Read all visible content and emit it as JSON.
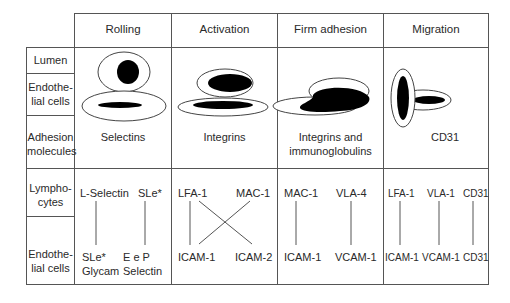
{
  "columns": [
    {
      "id": "rolling",
      "label": "Rolling"
    },
    {
      "id": "activation",
      "label": "Activation"
    },
    {
      "id": "firm_adhesion",
      "label": "Firm adhesion"
    },
    {
      "id": "migration",
      "label": "Migration"
    }
  ],
  "row_labels": {
    "lumen": "Lumen",
    "endothelial_top": [
      "Endothe-",
      "lial cells"
    ],
    "adhesion_molecules": [
      "Adhesion",
      "molecules"
    ],
    "lymphocytes": [
      "Lympho-",
      "cytes"
    ],
    "endothelial_bottom": [
      "Endothe-",
      "lial cells"
    ]
  },
  "adhesion_molecules": {
    "rolling": "Selectins",
    "activation": "Integrins",
    "firm_adhesion": [
      "Integrins and",
      "immunoglobulins"
    ],
    "migration": "CD31"
  },
  "pairs": {
    "rolling": {
      "lymphocyte": [
        "L-Selectin",
        "SLe*"
      ],
      "endothelial": [
        [
          "SLe*",
          "Glycam"
        ],
        [
          "E e P",
          "Selectin"
        ]
      ]
    },
    "activation": {
      "lymphocyte": [
        "LFA-1",
        "MAC-1"
      ],
      "endothelial": [
        "ICAM-1",
        "ICAM-2"
      ]
    },
    "firm_adhesion": {
      "lymphocyte": [
        "MAC-1",
        "VLA-4"
      ],
      "endothelial": [
        "ICAM-1",
        "VCAM-1"
      ]
    },
    "migration": {
      "lymphocyte": [
        "LFA-1",
        "VLA-1",
        "CD31"
      ],
      "endothelial": [
        "ICAM-1",
        "VCAM-1",
        "CD31"
      ]
    }
  },
  "colors": {
    "line": "#555555",
    "fill": "#000000",
    "text": "#2a2a2a"
  }
}
